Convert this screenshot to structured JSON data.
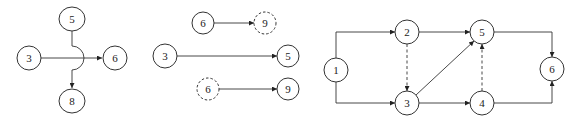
{
  "diagram": {
    "panels": [
      {
        "id": "crossing",
        "nodes": [
          {
            "id": "p1n5",
            "label": "5",
            "x": 72,
            "y": 19,
            "dashed": false
          },
          {
            "id": "p1n3",
            "label": "3",
            "x": 29,
            "y": 58,
            "dashed": false
          },
          {
            "id": "p1n6",
            "label": "6",
            "x": 115,
            "y": 58,
            "dashed": false
          },
          {
            "id": "p1n8",
            "label": "8",
            "x": 72,
            "y": 101,
            "dashed": false
          }
        ],
        "edges": [
          {
            "from": "3",
            "to": "6",
            "style": "solid"
          },
          {
            "from": "5",
            "to": "8",
            "style": "solid",
            "note": "crosses over with arc bridge"
          }
        ]
      },
      {
        "id": "virtual-nodes",
        "nodes": [
          {
            "id": "p2n6a",
            "label": "6",
            "x": 203,
            "y": 23,
            "dashed": false
          },
          {
            "id": "p2n9a",
            "label": "9",
            "x": 265,
            "y": 23,
            "dashed": true
          },
          {
            "id": "p2n3",
            "label": "3",
            "x": 165,
            "y": 56,
            "dashed": false
          },
          {
            "id": "p2n5",
            "label": "5",
            "x": 288,
            "y": 56,
            "dashed": false
          },
          {
            "id": "p2n6b",
            "label": "6",
            "x": 208,
            "y": 89,
            "dashed": true
          },
          {
            "id": "p2n9b",
            "label": "9",
            "x": 288,
            "y": 89,
            "dashed": false
          }
        ],
        "edges": [
          {
            "from": "6",
            "to": "9 (dashed)",
            "style": "solid"
          },
          {
            "from": "3",
            "to": "5",
            "style": "solid"
          },
          {
            "from": "6 (dashed)",
            "to": "9",
            "style": "solid"
          }
        ]
      },
      {
        "id": "network",
        "nodes": [
          {
            "id": "p3n1",
            "label": "1",
            "x": 336,
            "y": 70,
            "dashed": false
          },
          {
            "id": "p3n2",
            "label": "2",
            "x": 407,
            "y": 32,
            "dashed": false
          },
          {
            "id": "p3n3",
            "label": "3",
            "x": 407,
            "y": 103,
            "dashed": false
          },
          {
            "id": "p3n5",
            "label": "5",
            "x": 482,
            "y": 32,
            "dashed": false
          },
          {
            "id": "p3n4",
            "label": "4",
            "x": 482,
            "y": 103,
            "dashed": false
          },
          {
            "id": "p3n6",
            "label": "6",
            "x": 552,
            "y": 69,
            "dashed": false
          }
        ],
        "edges": [
          {
            "from": "1",
            "to": "2",
            "style": "solid"
          },
          {
            "from": "1",
            "to": "3",
            "style": "solid"
          },
          {
            "from": "2",
            "to": "5",
            "style": "solid"
          },
          {
            "from": "2",
            "to": "3",
            "style": "dashed"
          },
          {
            "from": "3",
            "to": "5",
            "style": "solid"
          },
          {
            "from": "3",
            "to": "4",
            "style": "solid"
          },
          {
            "from": "4",
            "to": "5",
            "style": "dashed"
          },
          {
            "from": "5",
            "to": "6",
            "style": "solid"
          },
          {
            "from": "4",
            "to": "6",
            "style": "solid"
          }
        ]
      }
    ]
  }
}
